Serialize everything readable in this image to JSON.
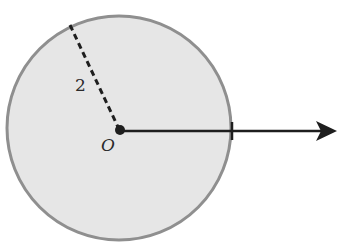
{
  "diagram": {
    "type": "circle-with-ray",
    "circle": {
      "cx": 119,
      "cy": 128,
      "r": 113,
      "fill": "#e6e6e6",
      "stroke": "#8f8f8f"
    },
    "center_label": "O",
    "radius_label": "2",
    "radius_line": {
      "x1": 70,
      "y1": 25,
      "x2": 119,
      "y2": 128,
      "style": "dashed"
    },
    "ray": {
      "x1": 119,
      "y1": 131,
      "x2": 336,
      "y2": 131,
      "arrow": true
    },
    "tick_mark": {
      "x": 232,
      "y": 131
    },
    "colors": {
      "line": "#1e1e1e",
      "circle_fill": "#e6e6e6",
      "circle_stroke": "#8f8f8f"
    }
  }
}
